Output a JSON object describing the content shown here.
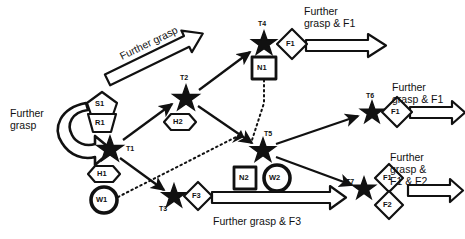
{
  "diagram": {
    "background": "#ffffff",
    "stroke": "#111111",
    "nodes": [
      {
        "id": "T1",
        "label": "T1",
        "x": 110,
        "y": 148,
        "shape": "star"
      },
      {
        "id": "T2",
        "label": "T2",
        "x": 186,
        "y": 97,
        "shape": "star"
      },
      {
        "id": "T3",
        "label": "T3",
        "x": 174,
        "y": 196,
        "shape": "star"
      },
      {
        "id": "T4",
        "label": "T4",
        "x": 264,
        "y": 43,
        "shape": "star"
      },
      {
        "id": "T5",
        "label": "T5",
        "x": 263,
        "y": 150,
        "shape": "star"
      },
      {
        "id": "T6",
        "label": "T6",
        "x": 372,
        "y": 112,
        "shape": "star"
      },
      {
        "id": "T7",
        "label": "T7",
        "x": 364,
        "y": 188,
        "shape": "star"
      }
    ],
    "attachments": [
      {
        "id": "S1",
        "label": "S1",
        "shape": "pentagon",
        "x": 102,
        "y": 102
      },
      {
        "id": "R1",
        "label": "R1",
        "shape": "trapezoid",
        "x": 102,
        "y": 123
      },
      {
        "id": "H1",
        "label": "H1",
        "shape": "hexagon",
        "x": 104,
        "y": 174
      },
      {
        "id": "W1",
        "label": "W1",
        "shape": "circle-thick",
        "x": 104,
        "y": 200
      },
      {
        "id": "H2",
        "label": "H2",
        "shape": "hexagon",
        "x": 180,
        "y": 122
      },
      {
        "id": "N1",
        "label": "N1",
        "shape": "square",
        "x": 264,
        "y": 68
      },
      {
        "id": "N2",
        "label": "N2",
        "shape": "square",
        "x": 245,
        "y": 178
      },
      {
        "id": "W2",
        "label": "W2",
        "shape": "circle-thick",
        "x": 277,
        "y": 178
      },
      {
        "id": "F1_T4",
        "label": "F1",
        "shape": "diamond",
        "x": 292,
        "y": 44
      },
      {
        "id": "F3_T3",
        "label": "F3",
        "shape": "diamond",
        "x": 198,
        "y": 196
      },
      {
        "id": "F1_T6",
        "label": "F1",
        "shape": "diamond",
        "x": 397,
        "y": 112
      },
      {
        "id": "F1_T7",
        "label": "F1",
        "shape": "diamond",
        "x": 389,
        "y": 178
      },
      {
        "id": "F2_T7",
        "label": "F2",
        "shape": "diamond",
        "x": 389,
        "y": 205
      }
    ],
    "captions": [
      {
        "id": "further-grasp-left",
        "text": "Further\ngrasp",
        "x": 10,
        "y": 113
      },
      {
        "id": "further-grasp-diagonal",
        "text": "Further grasp",
        "x": 122,
        "y": 55,
        "rotated": true
      },
      {
        "id": "further-grasp-f1-top",
        "text": "Further\ngrasp & F1",
        "x": 304,
        "y": 8
      },
      {
        "id": "further-grasp-f1-mid",
        "text": "Further\ngrasp & F1",
        "x": 392,
        "y": 86
      },
      {
        "id": "further-grasp-f1-f2",
        "text": "Further\ngrasp &\nF1 & F2",
        "x": 390,
        "y": 158
      },
      {
        "id": "further-grasp-f3",
        "text": "Further grasp & F3",
        "x": 213,
        "y": 219
      }
    ],
    "edges": [
      {
        "from": "T1",
        "to": "T2",
        "style": "solid"
      },
      {
        "from": "T1",
        "to": "T3",
        "style": "solid"
      },
      {
        "from": "T2",
        "to": "T4",
        "style": "solid"
      },
      {
        "from": "T2",
        "to": "T5",
        "style": "solid"
      },
      {
        "from": "T5",
        "to": "T6",
        "style": "solid"
      },
      {
        "from": "T5",
        "to": "T7",
        "style": "solid"
      },
      {
        "from": "W1",
        "to": "N1",
        "style": "dotted"
      },
      {
        "from": "W1",
        "to": "T5",
        "style": "dotted"
      },
      {
        "from": "T1",
        "to": "T1",
        "style": "curved-block-arrow"
      }
    ]
  }
}
